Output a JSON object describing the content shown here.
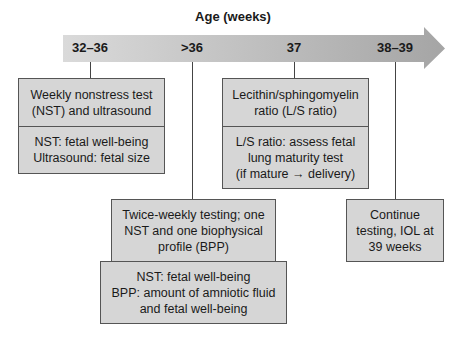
{
  "axis": {
    "title": "Age (weeks)",
    "ticks": [
      "32–36",
      ">36",
      "37",
      "38–39"
    ]
  },
  "boxes": {
    "wk32_36": {
      "header": "Weekly nonstress test (NST) and ultrasound",
      "header_lines": [
        "Weekly nonstress test",
        "(NST) and ultrasound"
      ],
      "detail_lines": [
        "NST: fetal well-being",
        "Ultrasound: fetal size"
      ]
    },
    "wk36plus": {
      "header_lines": [
        "Twice-weekly testing; one",
        "NST and one biophysical",
        "profile (BPP)"
      ],
      "detail_lines": [
        "NST: fetal well-being",
        "BPP: amount of amniotic fluid",
        "and fetal well-being"
      ]
    },
    "wk37": {
      "header_lines": [
        "Lecithin/sphingomyelin",
        "ratio (L/S ratio)"
      ],
      "detail_lines": [
        "L/S ratio: assess fetal",
        "lung maturity test",
        "(if mature → delivery)"
      ]
    },
    "wk38_39": {
      "header_lines": [
        "Continue",
        "testing, IOL at",
        "39 weeks"
      ]
    }
  },
  "colors": {
    "box_fill": "#d6d6d6",
    "arrow_start": "#d9d9d9",
    "arrow_end": "#a6a6a6"
  }
}
